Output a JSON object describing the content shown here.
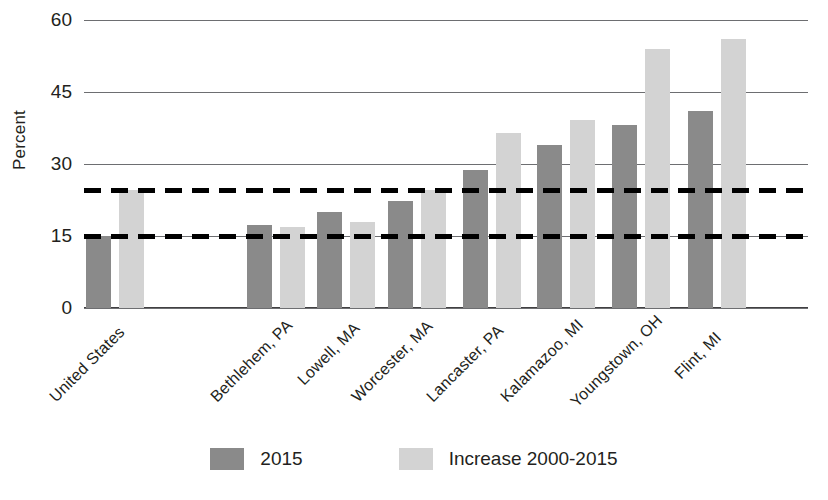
{
  "chart_data": {
    "type": "bar",
    "title": "",
    "subtitle": "",
    "xlabel": "",
    "ylabel": "Percent",
    "ylim": [
      0,
      60
    ],
    "yticks": [
      0,
      15,
      30,
      45,
      60
    ],
    "grid": true,
    "legend_position": "bottom",
    "categories": [
      "United States",
      "Bethlehem, PA",
      "Lowell, MA",
      "Worcester, MA",
      "Lancaster, PA",
      "Kalamazoo, MI",
      "Youngstown, OH",
      "Flint, MI"
    ],
    "series": [
      {
        "name": "2015",
        "color": "#8a8a8a",
        "values": [
          15.1,
          17.3,
          20.0,
          22.3,
          28.7,
          34.0,
          38.2,
          41.0
        ]
      },
      {
        "name": "Increase 2000-2015",
        "color": "#d3d3d3",
        "values": [
          24.5,
          16.8,
          18.0,
          24.5,
          36.5,
          39.2,
          54.0,
          56.0
        ]
      }
    ],
    "reference_lines": [
      {
        "name": "us-increase-2000-2015-reference",
        "value": 24.5,
        "style": "dashed",
        "color": "#000000"
      },
      {
        "name": "us-2015-reference",
        "value": 15.0,
        "style": "dashed",
        "color": "#000000"
      }
    ]
  },
  "legend": {
    "items": [
      {
        "label": "2015",
        "swatch": "series-a"
      },
      {
        "label": "Increase 2000-2015",
        "swatch": "series-b"
      }
    ]
  }
}
